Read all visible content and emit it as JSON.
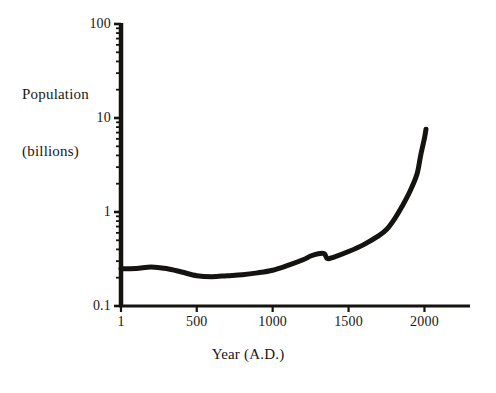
{
  "chart_data": {
    "type": "line",
    "title": "",
    "xlabel": "Year (A.D.)",
    "ylabel": "Population\n(billions)",
    "ylabel_line1": "Population",
    "ylabel_line2": "(billions)",
    "yscale": "log",
    "xscale": "linear",
    "xlim": [
      1,
      2300
    ],
    "ylim": [
      0.1,
      100
    ],
    "grid": false,
    "legend": null,
    "xticks": [
      1,
      500,
      1000,
      1500,
      2000
    ],
    "xtick_labels": [
      "1",
      "500",
      "1000",
      "1500",
      "2000"
    ],
    "yticks": [
      0.1,
      1,
      10,
      100
    ],
    "ytick_labels": [
      "0.1",
      "1",
      "10",
      "100"
    ],
    "yminor_ticks": [
      0.2,
      0.3,
      0.4,
      0.5,
      0.6,
      0.7,
      0.8,
      0.9,
      2,
      3,
      4,
      5,
      6,
      7,
      8,
      9,
      20,
      30,
      40,
      50,
      60,
      70,
      80,
      90
    ],
    "series": [
      {
        "name": "World population",
        "color": "#15130f",
        "linewidth": 5,
        "x": [
          1,
          100,
          200,
          300,
          400,
          500,
          600,
          700,
          800,
          900,
          1000,
          1100,
          1200,
          1250,
          1300,
          1340,
          1360,
          1400,
          1500,
          1600,
          1700,
          1750,
          1800,
          1850,
          1900,
          1950,
          1975,
          2000,
          2010
        ],
        "y": [
          0.25,
          0.25,
          0.26,
          0.25,
          0.23,
          0.21,
          0.205,
          0.21,
          0.215,
          0.225,
          0.24,
          0.27,
          0.31,
          0.34,
          0.36,
          0.36,
          0.32,
          0.33,
          0.38,
          0.45,
          0.56,
          0.65,
          0.83,
          1.13,
          1.6,
          2.5,
          4.0,
          6.1,
          7.6
        ]
      }
    ]
  }
}
